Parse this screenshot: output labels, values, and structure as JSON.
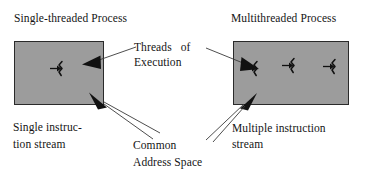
{
  "figure": {
    "background_color": "#ffffff",
    "process_box_fill": "#9c9c9c",
    "process_box_border": "#2a2a2a",
    "ink_color": "#141414"
  },
  "headings": {
    "single": "Single-threaded Process",
    "multi": "Multithreaded Process"
  },
  "callouts": {
    "threads_of_execution": {
      "line1": "Threads   of",
      "line2": "Execution",
      "full": "Threads of Execution"
    },
    "common_address_space": {
      "line1": "Common",
      "line2": "Address Space",
      "full": "Common Address Space"
    },
    "single_instruction_stream": {
      "line1": "Single instruc-",
      "line2": "tion stream",
      "full": "Single instruction stream"
    },
    "multiple_instruction_stream": {
      "line1": "Multiple instruction",
      "line2": "stream",
      "full": "Multiple instruction stream"
    }
  },
  "boxes": [
    {
      "id": "single-threaded-process-box",
      "label": "Single-threaded Process",
      "thread_count": 1
    },
    {
      "id": "multithreaded-process-box",
      "label": "Multithreaded Process",
      "thread_count": 3
    }
  ],
  "icons": {
    "thread": "thread-squiggle-icon",
    "arrow": "arrow-pointer-icon"
  }
}
